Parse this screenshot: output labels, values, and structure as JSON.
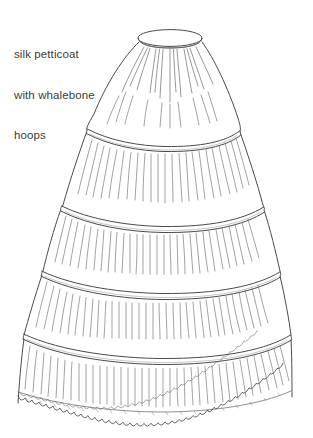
{
  "image": {
    "title": "silk petticoat with whalebone hoops illustration",
    "background_color": "#ffffff",
    "width": 313,
    "height": 438
  },
  "annotation": {
    "lines": [
      "silk petticoat",
      "with whalebone",
      "hoops"
    ],
    "line1": "silk petticoat",
    "line2": "with whalebone",
    "line3": "hoops",
    "color": "#3b3b3b"
  },
  "drawing": {
    "subject": "hooped petticoat",
    "style": "hand-drawn ink line sketch",
    "stroke_color": "#444444",
    "fill_color": "#ffffff",
    "parts": [
      {
        "name": "waistband-ellipse",
        "label": "waistband",
        "cx": 170,
        "cy": 38,
        "rx": 32,
        "ry": 8
      },
      {
        "name": "waistband-cuff",
        "label": "waistband cuff",
        "top_y": 38,
        "bottom_y": 47
      },
      {
        "name": "hoop-band-1",
        "label": "whalebone hoop 1",
        "y": 131,
        "left_x": 88,
        "right_x": 240
      },
      {
        "name": "hoop-band-2",
        "label": "whalebone hoop 2",
        "y": 208,
        "left_x": 62,
        "right_x": 264
      },
      {
        "name": "hoop-band-3",
        "label": "whalebone hoop 3",
        "y": 273,
        "left_x": 42,
        "right_x": 280
      },
      {
        "name": "hoop-band-4",
        "label": "whalebone hoop 4",
        "y": 336,
        "left_x": 24,
        "right_x": 291
      },
      {
        "name": "lace-hem",
        "label": "scalloped lace hem",
        "y": 404,
        "left_x": 18,
        "right_x": 292
      }
    ],
    "hoop_count": 4
  }
}
